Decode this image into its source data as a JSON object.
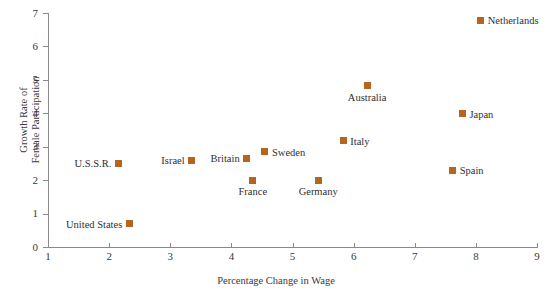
{
  "chart_data": {
    "type": "scatter",
    "title": "",
    "xlabel": "Percentage Change in Wage",
    "ylabel": "Growth Rate of\nFemale Participation",
    "xlim": [
      1,
      9
    ],
    "ylim": [
      0,
      7
    ],
    "xticks": [
      1,
      2,
      3,
      4,
      5,
      6,
      7,
      8,
      9
    ],
    "yticks": [
      0,
      1,
      2,
      3,
      4,
      5,
      6,
      7
    ],
    "grid": false,
    "legend": "none",
    "marker_color": "#b5651d",
    "marker_shape": "square",
    "axis_color": "#8a8a8a",
    "points": [
      {
        "label": "United States",
        "x": 2.33,
        "y": 0.7,
        "label_pos": "left"
      },
      {
        "label": "U.S.S.R.",
        "x": 2.15,
        "y": 2.5,
        "label_pos": "left"
      },
      {
        "label": "Israel",
        "x": 3.35,
        "y": 2.6,
        "label_pos": "left"
      },
      {
        "label": "Britain",
        "x": 4.25,
        "y": 2.65,
        "label_pos": "left"
      },
      {
        "label": "France",
        "x": 4.35,
        "y": 2.0,
        "label_pos": "below"
      },
      {
        "label": "Sweden",
        "x": 4.55,
        "y": 2.85,
        "label_pos": "right"
      },
      {
        "label": "Germany",
        "x": 5.42,
        "y": 2.0,
        "label_pos": "below"
      },
      {
        "label": "Italy",
        "x": 5.83,
        "y": 3.18,
        "label_pos": "right"
      },
      {
        "label": "Australia",
        "x": 6.22,
        "y": 4.82,
        "label_pos": "below"
      },
      {
        "label": "Spain",
        "x": 7.62,
        "y": 2.3,
        "label_pos": "right"
      },
      {
        "label": "Japan",
        "x": 7.78,
        "y": 3.98,
        "label_pos": "right"
      },
      {
        "label": "Netherlands",
        "x": 8.08,
        "y": 6.78,
        "label_pos": "right"
      }
    ]
  }
}
